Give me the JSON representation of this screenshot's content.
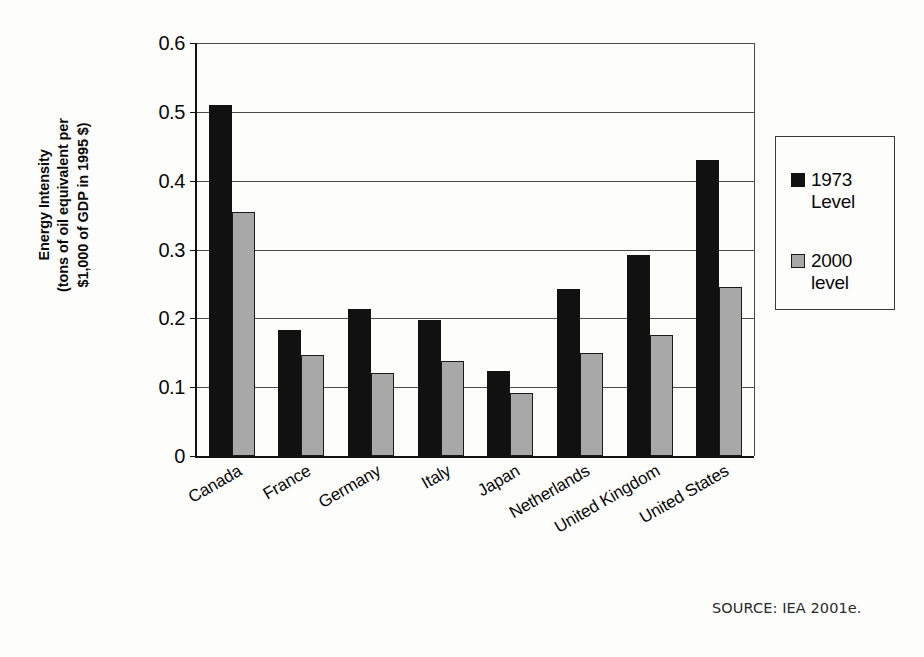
{
  "axis": {
    "y_title": "Energy Intensity\n(tons of oil equivalent per\n$1,000 of GDP in 1995 $)",
    "y_ticks": [
      "0.6",
      "0.5",
      "0.4",
      "0.3",
      "0.2",
      "0.1",
      "0"
    ]
  },
  "legend": {
    "entries": [
      {
        "label": "1973\nLevel",
        "color": "#111111",
        "swatch_class": "sw-1973"
      },
      {
        "label": "2000\nlevel",
        "color": "#a8a8a8",
        "swatch_class": "sw-2000"
      }
    ]
  },
  "source": {
    "text": "SOURCE: IEA 2001e."
  },
  "chart_data": {
    "type": "bar",
    "title": "",
    "xlabel": "",
    "ylabel": "Energy Intensity (tons of oil equivalent per $1,000 of GDP in 1995 $)",
    "ylim": [
      0,
      0.6
    ],
    "ytick_step": 0.1,
    "grid": true,
    "legend_position": "right",
    "categories": [
      "Canada",
      "France",
      "Germany",
      "Italy",
      "Japan",
      "Netherlands",
      "United Kingdom",
      "United States"
    ],
    "series": [
      {
        "name": "1973 Level",
        "color": "#111111",
        "values": [
          0.51,
          0.183,
          0.213,
          0.197,
          0.124,
          0.242,
          0.292,
          0.43
        ]
      },
      {
        "name": "2000 level",
        "color": "#a8a8a8",
        "values": [
          0.355,
          0.147,
          0.121,
          0.138,
          0.092,
          0.15,
          0.176,
          0.246
        ]
      }
    ]
  }
}
